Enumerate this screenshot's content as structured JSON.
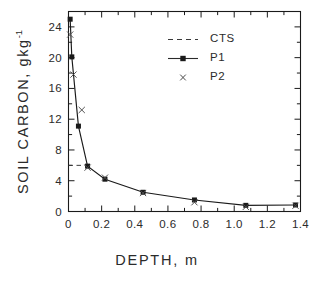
{
  "chart_data": {
    "type": "line",
    "title": "",
    "xlabel": "DEPTH,  m",
    "ylabel": "SOIL CARBON,  gkg",
    "ylabel_exponent": "-1",
    "xlim": [
      0,
      1.4
    ],
    "ylim": [
      0,
      26
    ],
    "xticks": [
      0,
      0.2,
      0.4,
      0.6,
      0.8,
      1.0,
      1.2,
      1.4
    ],
    "xtick_labels": [
      "0",
      "0.2",
      "0.4",
      "0.6",
      "0.8",
      "1.0",
      "1.2",
      "1.4"
    ],
    "yticks": [
      0,
      4,
      8,
      12,
      16,
      20,
      24
    ],
    "ytick_labels": [
      "0",
      "4",
      "8",
      "12",
      "16",
      "20",
      "24"
    ],
    "grid": false,
    "legend_position": "upper-center",
    "frame": "box",
    "tick_direction": "in",
    "color": "#1a1a1a",
    "series": [
      {
        "name": "CTS",
        "style": "dashed",
        "marker": "none",
        "reference_value": 6.0,
        "x": [
          0.0,
          0.115
        ],
        "values": [
          6.0,
          6.0
        ]
      },
      {
        "name": "P1",
        "style": "solid",
        "marker": "filled-square",
        "x": [
          0.01,
          0.02,
          0.06,
          0.115,
          0.22,
          0.45,
          0.76,
          1.07,
          1.37
        ],
        "values": [
          25.0,
          20.1,
          11.1,
          5.9,
          4.2,
          2.5,
          1.5,
          0.8,
          0.85
        ]
      },
      {
        "name": "P2",
        "style": "none",
        "marker": "x",
        "x": [
          0.01,
          0.03,
          0.08,
          0.115,
          0.22,
          0.45,
          0.76,
          1.07,
          1.37
        ],
        "values": [
          23.0,
          17.8,
          13.2,
          5.7,
          4.4,
          2.4,
          1.2,
          0.6,
          0.75
        ]
      }
    ]
  },
  "legend": {
    "items": [
      {
        "label": "CTS",
        "key": "dashed-line"
      },
      {
        "label": "P1",
        "key": "line-with-square-marker"
      },
      {
        "label": "P2",
        "key": "x-marker"
      }
    ]
  }
}
